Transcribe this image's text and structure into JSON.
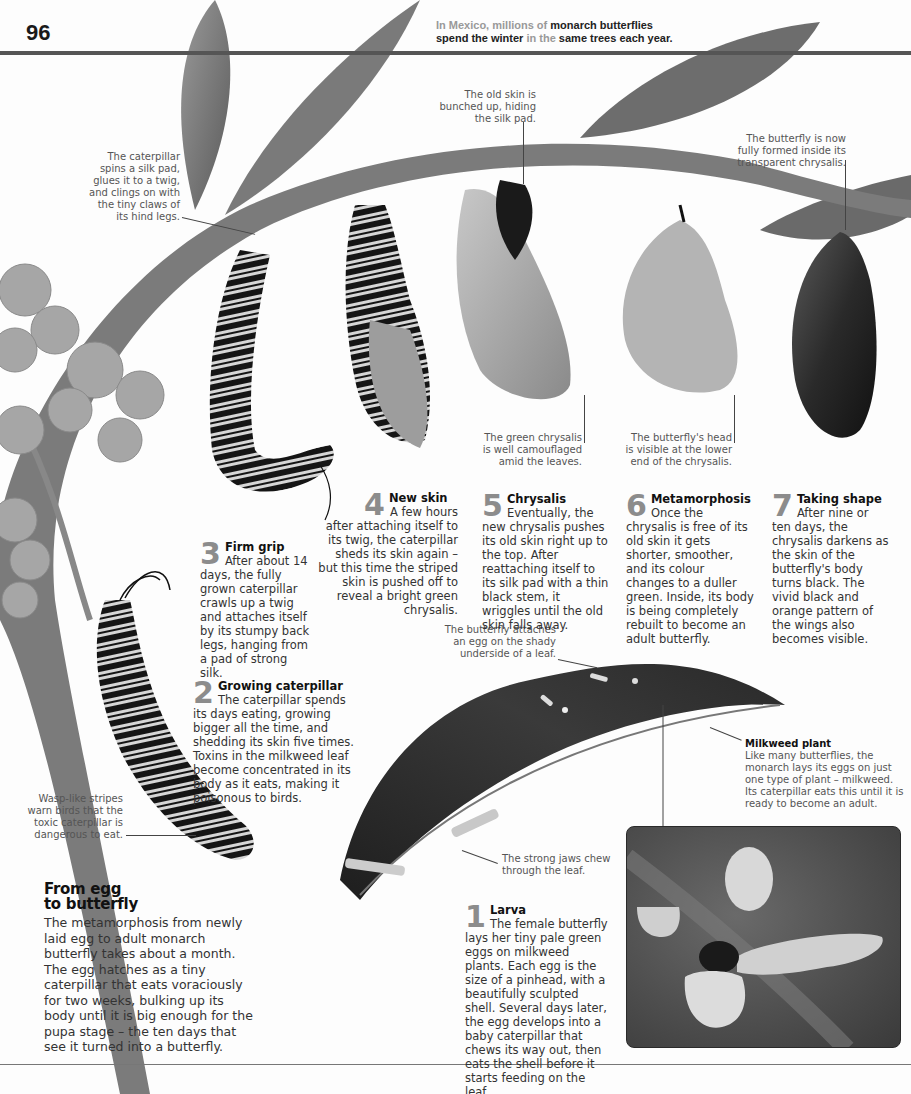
{
  "header": {
    "page_number": "96",
    "fact_muted_1": "In Mexico, millions of ",
    "fact_bold_1": "monarch butterflies",
    "fact_bold_2": "spend the winter ",
    "fact_muted_2": "in the ",
    "fact_bold_3": "same trees each year",
    "fact_end": "."
  },
  "captions": {
    "silk_pad": [
      "The caterpillar",
      "spins a silk pad,",
      "glues it to a twig,",
      "and clings on with",
      "the tiny claws of",
      "its hind legs."
    ],
    "old_skin": [
      "The old skin is",
      "bunched up, hiding",
      "the silk pad."
    ],
    "fully_formed": [
      "The butterfly is now",
      "fully formed inside its",
      "transparent chrysalis."
    ],
    "green_chrysalis": [
      "The green chrysalis",
      "is well camouflaged",
      "amid the leaves."
    ],
    "butterfly_head": [
      "The butterfly's head",
      "is visible at the lower",
      "end of the chrysalis."
    ],
    "egg_attach": [
      "The butterfly attaches",
      "an egg on the shady",
      "underside of a leaf."
    ],
    "wasp_stripes": [
      "Wasp-like stripes",
      "warn birds that the",
      "toxic caterpillar is",
      "dangerous to eat."
    ],
    "strong_jaws": [
      "The strong jaws chew",
      "through the leaf."
    ]
  },
  "steps": [
    {
      "num": "1",
      "title": "Larva",
      "body": "The female butterfly lays her tiny pale green eggs on milkweed plants. Each egg is the size of a pinhead, with a beautifully sculpted shell. Several days later, the egg develops into a baby caterpillar that chews its way out, then eats the shell before it starts feeding on the leaf."
    },
    {
      "num": "2",
      "title": "Growing caterpillar",
      "body": "The caterpillar spends its days eating, growing bigger all the time, and shedding its skin five times. Toxins in the milkweed leaf become concentrated in its body as it eats, making it poisonous to birds."
    },
    {
      "num": "3",
      "title": "Firm grip",
      "body": "After about 14 days, the fully grown caterpillar crawls up a twig and attaches itself by its stumpy back legs, hanging from a pad of strong silk."
    },
    {
      "num": "4",
      "title": "New skin",
      "body": "A few hours after attaching itself to its twig, the caterpillar sheds its skin again – but this time the striped skin is pushed off to reveal a bright green chrysalis."
    },
    {
      "num": "5",
      "title": "Chrysalis",
      "body": "Eventually, the new chrysalis pushes its old skin right up to the top. After reattaching itself to its silk pad with a thin black stem, it wriggles until the old skin falls away."
    },
    {
      "num": "6",
      "title": "Metamorphosis",
      "body": "Once the chrysalis is free of its old skin it gets shorter, smoother, and its colour changes to a duller green. Inside, its body is being completely rebuilt to become an adult butterfly."
    },
    {
      "num": "7",
      "title": "Taking shape",
      "body": "After nine or ten days, the chrysalis darkens as the skin of the butterfly's body turns black. The vivid black and orange pattern of the wings also becomes visible."
    }
  ],
  "milkweed": {
    "title": "Milkweed plant",
    "body": "Like many butterflies, the monarch lays its eggs on just one type of plant – milkweed. Its caterpillar eats this until it is ready to become an adult."
  },
  "intro": {
    "title_line1": "From egg",
    "title_line2": "to butterfly",
    "body": "The metamorphosis from newly laid egg to adult monarch butterfly takes about a month. The egg hatches as a tiny caterpillar that eats voraciously for two weeks, bulking up its body until it is big enough for the pupa stage – the ten days that see it turned into a butterfly."
  }
}
